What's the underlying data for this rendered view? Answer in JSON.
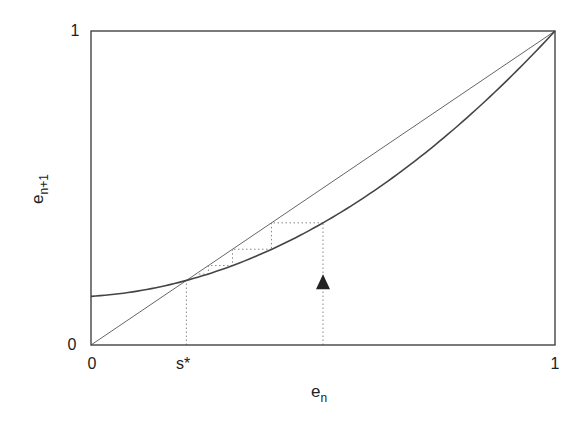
{
  "chart_data": {
    "type": "line",
    "title": "",
    "xlabel": "e_n",
    "ylabel": "e_{n+1}",
    "xlim": [
      0,
      1
    ],
    "ylim": [
      0,
      1
    ],
    "grid": false,
    "x_ticks": [
      {
        "value": 0,
        "label": "0"
      },
      {
        "value": 0.2056,
        "label": "s*"
      },
      {
        "value": 1,
        "label": "1"
      }
    ],
    "y_ticks": [
      {
        "value": 0,
        "label": "0"
      },
      {
        "value": 1,
        "label": "1"
      }
    ],
    "series": [
      {
        "name": "map curve",
        "description": "convex iteration map e_{n+1} = f(e_n), approx f(x) = 0.155 + 0.091x + 0.754x^2",
        "x": [
          0,
          0.1,
          0.2,
          0.3,
          0.4,
          0.5,
          0.6,
          0.7,
          0.8,
          0.9,
          1.0
        ],
        "y": [
          0.155,
          0.172,
          0.203,
          0.25,
          0.312,
          0.389,
          0.481,
          0.588,
          0.71,
          0.848,
          1.0
        ],
        "color": "#444444"
      },
      {
        "name": "identity line",
        "description": "diagonal e_{n+1} = e_n",
        "x": [
          0,
          1
        ],
        "y": [
          0,
          1
        ],
        "color": "#666666"
      }
    ],
    "fixed_points": [
      {
        "label": "s*",
        "x": 0.2056,
        "y": 0.2056
      },
      {
        "x": 1,
        "y": 1
      }
    ],
    "cobweb": {
      "start": 0.5,
      "iterates": [
        0.5,
        0.389,
        0.305,
        0.253,
        0.226
      ],
      "style": "dotted"
    },
    "annotations": [
      {
        "type": "triangle-up-marker",
        "x": 0.5,
        "y": 0.2,
        "description": "marker on vertical dotted line at starting point e_n = 0.5"
      },
      {
        "type": "dotted-vertical",
        "x": 0.2056,
        "from": 0,
        "to": 0.2056,
        "description": "drop line from fixed point s*"
      },
      {
        "type": "dotted-vertical",
        "x": 0.5,
        "from": 0,
        "to": 0.389,
        "description": "drop line from start point"
      }
    ],
    "legend": null
  },
  "labels": {
    "x_axis": "e",
    "x_axis_sub": "n",
    "y_axis": "e",
    "y_axis_sub": "n+1",
    "x_tick_0": "0",
    "x_tick_1": "1",
    "x_tick_s": "s*",
    "y_tick_0": "0",
    "y_tick_1": "1"
  }
}
